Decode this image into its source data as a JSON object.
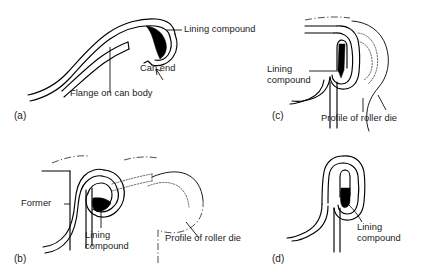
{
  "figure": {
    "background_color": "#ffffff",
    "line_color": "#000000",
    "compound_color": "#000000"
  },
  "panels": [
    {
      "tag": "(a)",
      "stage": "flange and can end with lining compound before seaming",
      "labels": [
        {
          "name": "lining-compound",
          "text": "Lining compound"
        },
        {
          "name": "can-end",
          "text": "Can end"
        },
        {
          "name": "flange-on-can-body",
          "text": "Flange on can body"
        }
      ]
    },
    {
      "tag": "(b)",
      "stage": "first operation roller die forming the curl over the former",
      "labels": [
        {
          "name": "former",
          "text": "Former"
        },
        {
          "name": "lining-compound",
          "text": "Lining\ncompound"
        },
        {
          "name": "profile-of-roller-die",
          "text": "Profile of roller die"
        }
      ]
    },
    {
      "tag": "(c)",
      "stage": "second operation roller die flattening the seam",
      "labels": [
        {
          "name": "lining-compound",
          "text": "Lining\ncompound"
        },
        {
          "name": "profile-of-roller-die",
          "text": "Profile of roller die"
        }
      ]
    },
    {
      "tag": "(d)",
      "stage": "completed double seam",
      "labels": [
        {
          "name": "lining-compound",
          "text": "Lining\ncompound"
        }
      ]
    }
  ]
}
